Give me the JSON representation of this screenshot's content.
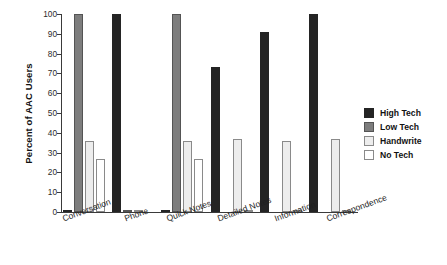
{
  "chart_data": {
    "type": "bar",
    "title": "",
    "xlabel": "",
    "ylabel": "Percent of AAC Users",
    "ylim": [
      0,
      100
    ],
    "ytick_step": 10,
    "yticks": [
      0,
      10,
      20,
      30,
      40,
      50,
      60,
      70,
      80,
      90,
      100
    ],
    "grid": false,
    "legend_position": "right",
    "categories": [
      "Conversation",
      "Phone",
      "Quick Notes",
      "Detailed Notes",
      "Information",
      "Correspondence"
    ],
    "series": [
      {
        "name": "High Tech",
        "color": "#242424",
        "values": [
          1,
          100,
          1,
          73,
          91,
          100
        ]
      },
      {
        "name": "Low Tech",
        "color": "#7d7d7d",
        "values": [
          100,
          1,
          100,
          0,
          0,
          0
        ]
      },
      {
        "name": "Handwrite",
        "color": "#ededed",
        "values": [
          36,
          1,
          36,
          37,
          36,
          37
        ]
      },
      {
        "name": "No Tech",
        "color": "#ffffff",
        "values": [
          27,
          0,
          27,
          1,
          1,
          1
        ]
      }
    ]
  },
  "legend": {
    "items": [
      {
        "label": "High Tech"
      },
      {
        "label": "Low Tech"
      },
      {
        "label": "Handwrite"
      },
      {
        "label": "No Tech"
      }
    ]
  }
}
